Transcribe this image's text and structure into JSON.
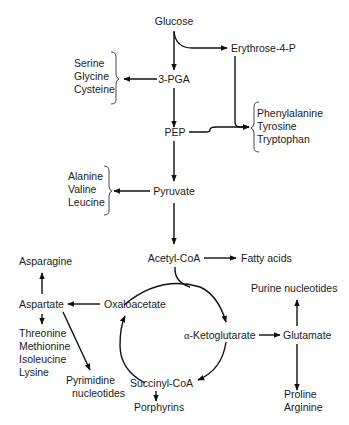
{
  "nodes": {
    "glucose": "Glucose",
    "erythrose4p": "Erythrose-4-P",
    "pga3": "3-PGA",
    "pep": "PEP",
    "pyruvate": "Pyruvate",
    "acetylcoa": "Acetyl-CoA",
    "fattyacids": "Fatty acids",
    "oxaloacetate": "Oxaloacetate",
    "aspartate": "Aspartate",
    "asparagine": "Asparagine",
    "akg_prefix": "α",
    "akg": "-Ketoglutarate",
    "glutamate": "Glutamate",
    "purine": "Purine nucleotides",
    "succinylcoa": "Succinyl-CoA",
    "porphyrins": "Porphyrins",
    "pyrimidine": [
      "Pyrimidine",
      "nucleotides"
    ],
    "proline_arginine": [
      "Proline",
      "Arginine"
    ]
  },
  "groups": {
    "serine_family": [
      "Serine",
      "Glycine",
      "Cysteine"
    ],
    "aromatic_family": [
      "Phenylalanine",
      "Tyrosine",
      "Tryptophan"
    ],
    "pyruvate_family": [
      "Alanine",
      "Valine",
      "Leucine"
    ],
    "aspartate_family": [
      "Threonine",
      "Methionine",
      "Isoleucine",
      "Lysine"
    ]
  },
  "edges": [
    {
      "from": "Glucose",
      "to": "3-PGA"
    },
    {
      "from": "Glucose",
      "to": "Erythrose-4-P"
    },
    {
      "from": "3-PGA",
      "to": "Serine/Glycine/Cysteine"
    },
    {
      "from": "3-PGA",
      "to": "PEP"
    },
    {
      "from": "Erythrose-4-P",
      "to": "Phenylalanine/Tyrosine/Tryptophan"
    },
    {
      "from": "PEP",
      "to": "Phenylalanine/Tyrosine/Tryptophan"
    },
    {
      "from": "PEP",
      "to": "Pyruvate"
    },
    {
      "from": "Pyruvate",
      "to": "Alanine/Valine/Leucine"
    },
    {
      "from": "Pyruvate",
      "to": "Acetyl-CoA"
    },
    {
      "from": "Acetyl-CoA",
      "to": "Fatty acids"
    },
    {
      "from": "Acetyl-CoA",
      "to": "α-Ketoglutarate"
    },
    {
      "from": "Oxaloacetate",
      "to": "α-Ketoglutarate"
    },
    {
      "from": "α-Ketoglutarate",
      "to": "Succinyl-CoA"
    },
    {
      "from": "Succinyl-CoA",
      "to": "Oxaloacetate"
    },
    {
      "from": "α-Ketoglutarate",
      "to": "Glutamate"
    },
    {
      "from": "Glutamate",
      "to": "Purine nucleotides"
    },
    {
      "from": "Glutamate",
      "to": "Proline/Arginine"
    },
    {
      "from": "Succinyl-CoA",
      "to": "Porphyrins"
    },
    {
      "from": "Oxaloacetate",
      "to": "Aspartate"
    },
    {
      "from": "Aspartate",
      "to": "Asparagine"
    },
    {
      "from": "Aspartate",
      "to": "Threonine/Methionine/Isoleucine/Lysine"
    },
    {
      "from": "Aspartate",
      "to": "Pyrimidine nucleotides"
    }
  ]
}
